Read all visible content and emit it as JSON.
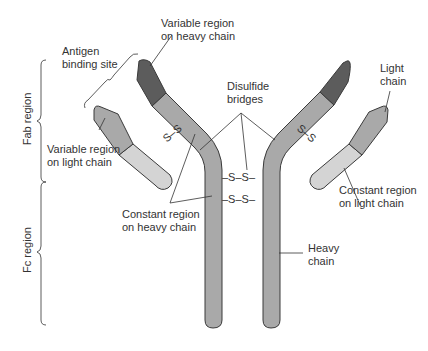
{
  "diagram": {
    "colors": {
      "heavy_variable": "#5c5c5c",
      "heavy_constant": "#a9a9a9",
      "light_variable": "#a9a9a9",
      "light_constant": "#d4d4d4",
      "outline": "#3a3a3a",
      "text": "#333333"
    },
    "labels": {
      "variable_heavy_1": "Variable region",
      "variable_heavy_2": "on heavy chain",
      "antigen_1": "Antigen",
      "antigen_2": "binding site",
      "disulfide_1": "Disulfide",
      "disulfide_2": "bridges",
      "light_chain_1": "Light",
      "light_chain_2": "chain",
      "variable_light_1": "Variable region",
      "variable_light_2": "on light chain",
      "constant_light_1": "Constant region",
      "constant_light_2": "on light chain",
      "constant_heavy_1": "Constant region",
      "constant_heavy_2": "on heavy chain",
      "heavy_chain_1": "Heavy",
      "heavy_chain_2": "chain",
      "fab_region": "Fab region",
      "fc_region": "Fc region"
    },
    "bonds": {
      "left_light": "S–S",
      "right_light": "S–S",
      "hinge_1": "–S–S–",
      "hinge_2": "–S–S–"
    }
  }
}
